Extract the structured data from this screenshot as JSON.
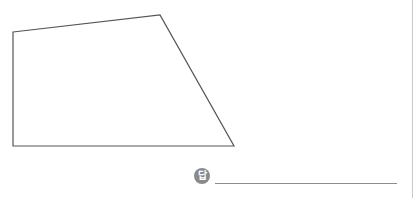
{
  "figure": {
    "shape": "quadrilateral",
    "vertices": [
      [
        13,
        32
      ],
      [
        160,
        15
      ],
      [
        234,
        146
      ],
      [
        13,
        146
      ]
    ],
    "stroke_color": "#555555"
  },
  "answer": {
    "icon_label": "답",
    "value": ""
  },
  "colors": {
    "line": "#8c8c8c",
    "icon_bg": "#8a8a8a",
    "border": "#c8c8c8"
  }
}
